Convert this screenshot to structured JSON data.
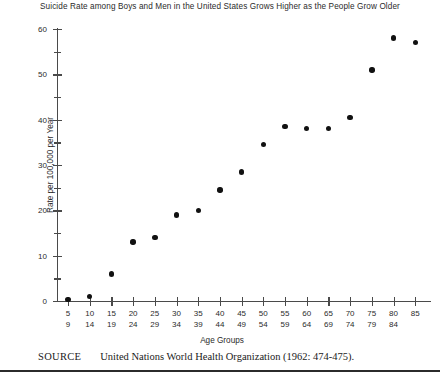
{
  "chart_data": {
    "type": "scatter",
    "title": "Suicide Rate among Boys and Men in the United States Grows Higher as the People Grow Older",
    "xlabel": "Age Groups",
    "ylabel": "Rate per 100,000 per Year",
    "categories": [
      "5\n9",
      "10\n14",
      "15\n19",
      "20\n24",
      "25\n29",
      "30\n34",
      "35\n39",
      "40\n44",
      "45\n49",
      "50\n54",
      "55\n59",
      "60\n64",
      "65\n69",
      "70\n74",
      "75\n79",
      "80\n84",
      "85"
    ],
    "category_labels": [
      {
        "top": "5",
        "bottom": "9"
      },
      {
        "top": "10",
        "bottom": "14"
      },
      {
        "top": "15",
        "bottom": "19"
      },
      {
        "top": "20",
        "bottom": "24"
      },
      {
        "top": "25",
        "bottom": "29"
      },
      {
        "top": "30",
        "bottom": "34"
      },
      {
        "top": "35",
        "bottom": "39"
      },
      {
        "top": "40",
        "bottom": "44"
      },
      {
        "top": "45",
        "bottom": "49"
      },
      {
        "top": "50",
        "bottom": "54"
      },
      {
        "top": "55",
        "bottom": "59"
      },
      {
        "top": "60",
        "bottom": "64"
      },
      {
        "top": "65",
        "bottom": "69"
      },
      {
        "top": "70",
        "bottom": "74"
      },
      {
        "top": "75",
        "bottom": "79"
      },
      {
        "top": "80",
        "bottom": "84"
      },
      {
        "top": "85",
        "bottom": ""
      }
    ],
    "values": [
      0.3,
      1.0,
      6.0,
      13.0,
      14.0,
      19.0,
      20.0,
      24.5,
      28.5,
      34.5,
      38.5,
      38.0,
      38.0,
      40.5,
      51.0,
      58.0,
      57.0
    ],
    "ylim": [
      0,
      60
    ],
    "ytick_major": [
      0,
      10,
      20,
      30,
      40,
      50,
      60
    ],
    "ytick_minor": [
      5,
      15,
      25,
      35,
      45,
      55
    ],
    "ytick_labels": [
      "0",
      "10",
      "20",
      "30",
      "40",
      "50",
      "60"
    ],
    "grid": false,
    "legend": null,
    "marker_color": "#111111",
    "axis_color": "#4a4a4a"
  },
  "source": {
    "label": "SOURCE",
    "text": "United Nations World Health Organization (1962: 474-475)."
  }
}
